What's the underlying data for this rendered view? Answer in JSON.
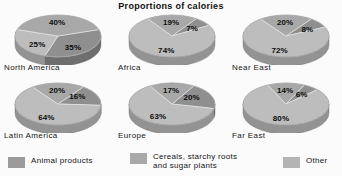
{
  "title": "Proportions of calories",
  "colors": {
    "animal_products": "#8f8f8f",
    "cereals": "#a9a9a9",
    "other": "#c8c8c8",
    "animal_products_side": "#6f6f6f",
    "cereals_side": "#8a8a8a",
    "other_side": "#a5a5a5",
    "background": "#fbfbfb",
    "text": "#111111"
  },
  "legend": {
    "items": [
      {
        "label": "Animal products",
        "color_key": "animal_products",
        "swatch": "#9b9b9b"
      },
      {
        "label": "Cereals, starchy roots\nand sugar plants",
        "color_key": "cereals",
        "swatch": "#a9a9a9"
      },
      {
        "label": "Other",
        "color_key": "other",
        "swatch": "#b4b4b4"
      }
    ]
  },
  "chart_data": {
    "type": "pie",
    "title": "Proportions of calories",
    "legend_position": "bottom",
    "series_names": [
      "Animal products",
      "Cereals, starchy roots and sugar plants",
      "Other"
    ],
    "unit": "%",
    "charts": [
      {
        "name": "North America",
        "slices": [
          {
            "category": "Animal products",
            "value": 35,
            "label": "35%"
          },
          {
            "category": "Cereals, starchy roots and sugar plants",
            "value": 25,
            "label": "25%"
          },
          {
            "category": "Other",
            "value": 40,
            "label": "40%"
          }
        ]
      },
      {
        "name": "Africa",
        "slices": [
          {
            "category": "Animal products",
            "value": 7,
            "label": "7%"
          },
          {
            "category": "Cereals, starchy roots and sugar plants",
            "value": 74,
            "label": "74%"
          },
          {
            "category": "Other",
            "value": 19,
            "label": "19%"
          }
        ]
      },
      {
        "name": "Near East",
        "slices": [
          {
            "category": "Animal products",
            "value": 8,
            "label": "8%"
          },
          {
            "category": "Cereals, starchy roots and sugar plants",
            "value": 72,
            "label": "72%"
          },
          {
            "category": "Other",
            "value": 20,
            "label": "20%"
          }
        ]
      },
      {
        "name": "Latin America",
        "slices": [
          {
            "category": "Animal products",
            "value": 16,
            "label": "16%"
          },
          {
            "category": "Cereals, starchy roots and sugar plants",
            "value": 64,
            "label": "64%"
          },
          {
            "category": "Other",
            "value": 20,
            "label": "20%"
          }
        ]
      },
      {
        "name": "Europe",
        "slices": [
          {
            "category": "Animal products",
            "value": 20,
            "label": "20%"
          },
          {
            "category": "Cereals, starchy roots and sugar plants",
            "value": 63,
            "label": "63%"
          },
          {
            "category": "Other",
            "value": 17,
            "label": "17%"
          }
        ]
      },
      {
        "name": "Far East",
        "slices": [
          {
            "category": "Animal products",
            "value": 6,
            "label": "6%"
          },
          {
            "category": "Cereals, starchy roots and sugar plants",
            "value": 80,
            "label": "80%"
          },
          {
            "category": "Other",
            "value": 14,
            "label": "14%"
          }
        ]
      }
    ]
  }
}
